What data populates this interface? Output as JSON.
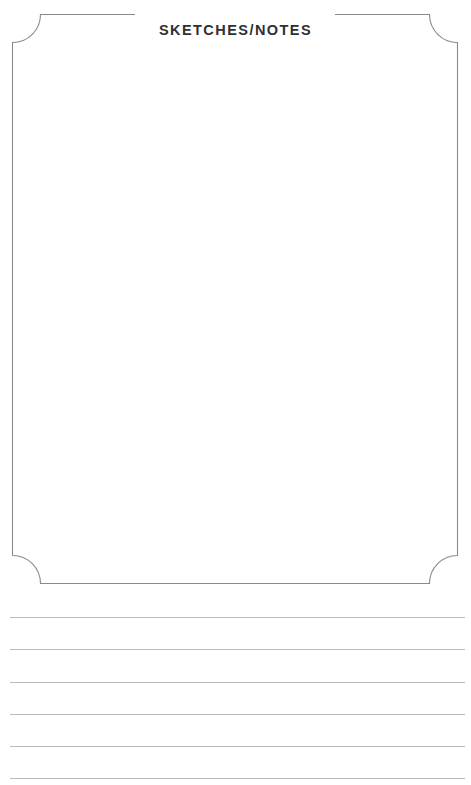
{
  "page": {
    "kind": "notebook-page",
    "width": 471,
    "height": 785,
    "background_color": "#ffffff"
  },
  "header": {
    "title": "SKETCHES/NOTES"
  },
  "sketch_box": {
    "label": "sketch area",
    "x": 12,
    "y": 14,
    "width": 446,
    "height": 569,
    "corner_style": "concave-notch",
    "corner_radius": 28,
    "stroke_color": "#8a8a8e",
    "stroke_width": 1.1,
    "fill_color": "#ffffff",
    "content": ""
  },
  "ruled_section": {
    "label": "notes lines",
    "line_color": "#b9babd",
    "line_left": 10,
    "line_right": 465,
    "line_spacing": 32.3,
    "first_line_y": 617,
    "line_count": 6,
    "lines": [
      {
        "index": 1,
        "y": 617,
        "text": ""
      },
      {
        "index": 2,
        "y": 649,
        "text": ""
      },
      {
        "index": 3,
        "y": 682,
        "text": ""
      },
      {
        "index": 4,
        "y": 714,
        "text": ""
      },
      {
        "index": 5,
        "y": 746,
        "text": ""
      },
      {
        "index": 6,
        "y": 778,
        "text": ""
      }
    ]
  }
}
